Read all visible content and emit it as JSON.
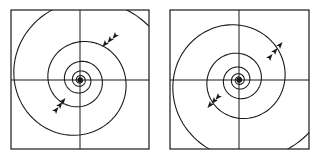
{
  "figure": {
    "panels": [
      {
        "id": "left",
        "frame": {
          "x": 11,
          "y": 10,
          "w": 138,
          "h": 139
        },
        "center": {
          "x": 80,
          "y": 80
        },
        "direction": "inward",
        "arrow_sites": [
          {
            "x": 105,
            "y": 44,
            "angle": 130
          },
          {
            "x": 110,
            "y": 40,
            "angle": 130
          },
          {
            "x": 115,
            "y": 36,
            "angle": 130
          },
          {
            "x": 56,
            "y": 110,
            "angle": -50
          },
          {
            "x": 60,
            "y": 105,
            "angle": -50
          },
          {
            "x": 63,
            "y": 101,
            "angle": -50
          }
        ]
      },
      {
        "id": "right",
        "frame": {
          "x": 170,
          "y": 10,
          "w": 139,
          "h": 139
        },
        "center": {
          "x": 239,
          "y": 80
        },
        "direction": "outward",
        "arrow_sites": [
          {
            "x": 270,
            "y": 57,
            "angle": -50
          },
          {
            "x": 275,
            "y": 51,
            "angle": -50
          },
          {
            "x": 280,
            "y": 45,
            "angle": -50
          },
          {
            "x": 210,
            "y": 105,
            "angle": 130
          },
          {
            "x": 214,
            "y": 101,
            "angle": 130
          },
          {
            "x": 218,
            "y": 97,
            "angle": 130
          }
        ]
      }
    ],
    "colors": {
      "line": "#1a1a1a",
      "background": "#ffffff"
    }
  }
}
